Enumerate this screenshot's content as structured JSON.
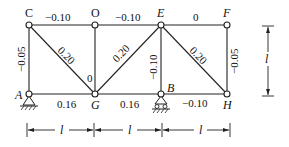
{
  "diagram": {
    "type": "truss",
    "nodes": [
      {
        "id": "C",
        "label": "C",
        "x": 29,
        "y": 25
      },
      {
        "id": "O",
        "label": "O",
        "x": 95,
        "y": 25
      },
      {
        "id": "E",
        "label": "E",
        "x": 161,
        "y": 25
      },
      {
        "id": "F",
        "label": "F",
        "x": 227,
        "y": 25
      },
      {
        "id": "A",
        "label": "A",
        "x": 29,
        "y": 94
      },
      {
        "id": "G",
        "label": "G",
        "x": 95,
        "y": 94
      },
      {
        "id": "B",
        "label": "B",
        "x": 161,
        "y": 94
      },
      {
        "id": "H",
        "label": "H",
        "x": 227,
        "y": 94
      }
    ],
    "members": [
      {
        "from": "C",
        "to": "O",
        "label": "-0.10"
      },
      {
        "from": "O",
        "to": "E",
        "label": "-0.10"
      },
      {
        "from": "E",
        "to": "F",
        "label": "0"
      },
      {
        "from": "A",
        "to": "G",
        "label": "0.16"
      },
      {
        "from": "G",
        "to": "B",
        "label": "0.16"
      },
      {
        "from": "B",
        "to": "H",
        "label": "-0.10"
      },
      {
        "from": "C",
        "to": "A",
        "label": "-0.05"
      },
      {
        "from": "O",
        "to": "G",
        "label": "0"
      },
      {
        "from": "E",
        "to": "B",
        "label": "-0.10"
      },
      {
        "from": "F",
        "to": "H",
        "label": "-0.05"
      },
      {
        "from": "C",
        "to": "G",
        "label": "0.20"
      },
      {
        "from": "G",
        "to": "E",
        "label": "0.20"
      },
      {
        "from": "E",
        "to": "H",
        "label": "0.20"
      }
    ],
    "supports": [
      {
        "node": "A",
        "type": "pin"
      },
      {
        "node": "B",
        "type": "roller"
      }
    ],
    "dimensions": {
      "horizontal": [
        "l",
        "l",
        "l"
      ],
      "vertical": "l"
    }
  },
  "labels": {
    "CO": "−0.10",
    "OE": "−0.10",
    "EF": "0",
    "AG": "0.16",
    "GB": "0.16",
    "BH": "−0.10",
    "CA": "−0.05",
    "OG": "0",
    "EB": "−0.10",
    "FH": "−0.05",
    "CG": "0.20",
    "GE": "0.20",
    "EH": "0.20",
    "node_C": "C",
    "node_O": "O",
    "node_E": "E",
    "node_F": "F",
    "node_A": "A",
    "node_G": "G",
    "node_B": "B",
    "node_H": "H",
    "dim_h1": "l",
    "dim_h2": "l",
    "dim_h3": "l",
    "dim_v": "l"
  }
}
